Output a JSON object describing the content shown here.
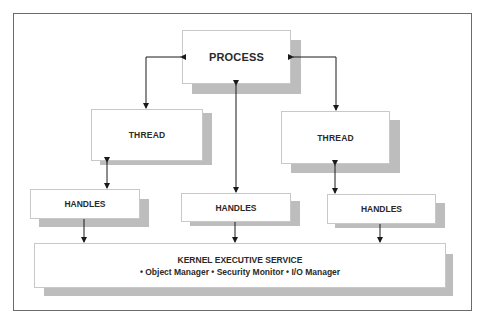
{
  "diagram": {
    "process": {
      "label": "PROCESS"
    },
    "threads": [
      {
        "label": "THREAD"
      },
      {
        "label": "THREAD"
      }
    ],
    "handles": [
      {
        "label": "HANDLES"
      },
      {
        "label": "HANDLES"
      },
      {
        "label": "HANDLES"
      }
    ],
    "kernel": {
      "title": "KERNEL EXECUTIVE SERVICE",
      "components": "• Object Manager • Security Monitor • I/O Manager"
    },
    "colors": {
      "box_fill": "#ffffff",
      "box_border": "#c8c8c8",
      "shadow": "#bdbdbd",
      "frame": "#6b6b6b",
      "connector": "#1a1a1a",
      "text": "#2a2a2a"
    }
  }
}
